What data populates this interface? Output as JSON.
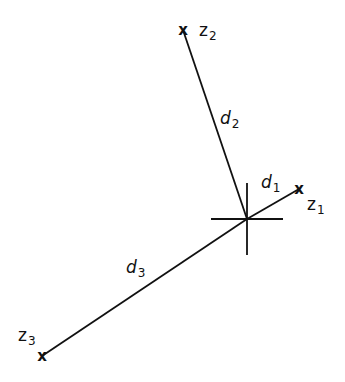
{
  "diagram": {
    "type": "geometry",
    "colors": {
      "line": "#111111",
      "background": "#ffffff"
    },
    "center": {
      "name": "estimate",
      "x": 247,
      "y": 219,
      "crosshair_half_width": 36,
      "crosshair_half_height": 36
    },
    "points": [
      {
        "id": "z1",
        "marker": "x",
        "label_main": "z",
        "label_sub": "1",
        "x": 299,
        "y": 189
      },
      {
        "id": "z2",
        "marker": "x",
        "label_main": "z",
        "label_sub": "2",
        "x": 183,
        "y": 30
      },
      {
        "id": "z3",
        "marker": "x",
        "label_main": "z",
        "label_sub": "3",
        "x": 42,
        "y": 356
      }
    ],
    "distances": [
      {
        "id": "d1",
        "label_main": "d",
        "label_sub": "1",
        "from": "center",
        "to": "z1"
      },
      {
        "id": "d2",
        "label_main": "d",
        "label_sub": "2",
        "from": "center",
        "to": "z2"
      },
      {
        "id": "d3",
        "label_main": "d",
        "label_sub": "3",
        "from": "center",
        "to": "z3"
      }
    ]
  }
}
